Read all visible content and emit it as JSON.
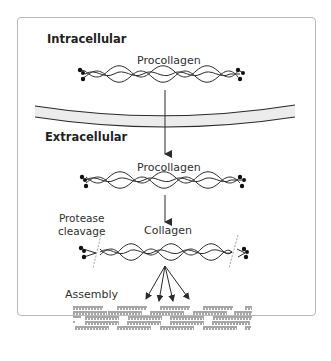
{
  "diagram": {
    "sections": {
      "intracellular": "Intracellular",
      "extracellular": "Extracellular"
    },
    "molecules": {
      "procollagen_intracellular": "Procollagen",
      "procollagen_extracellular": "Procollagen",
      "collagen": "Collagen"
    },
    "annotations": {
      "protease_line1": "Protease",
      "protease_line2": "cleavage",
      "assembly": "Assembly"
    },
    "flow": [
      "Procollagen (intracellular)",
      "crosses membrane",
      "Procollagen (extracellular)",
      "Protease cleavage",
      "Collagen",
      "Assembly into fibrils"
    ],
    "colors": {
      "stroke": "#2b2b2b",
      "membrane_fill": "#ececec",
      "frame_border": "#b9b9b9",
      "cleavage_line": "#8a8a8a"
    }
  }
}
